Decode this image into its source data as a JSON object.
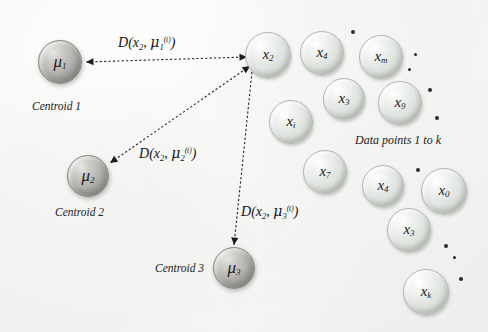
{
  "figure": {
    "background_color": "#f5f5f4",
    "data_node_color": "#dfe3df",
    "centroid_node_color": "#b3b2ae",
    "ink_color": "#1b1b1b"
  },
  "centroids": [
    {
      "id": "mu1",
      "symbol": "μ",
      "sub": "1",
      "caption": "Centroid 1",
      "x": 60,
      "y": 62,
      "r": 22
    },
    {
      "id": "mu2",
      "symbol": "μ",
      "sub": "2",
      "caption": "Centroid 2",
      "x": 88,
      "y": 176,
      "r": 21
    },
    {
      "id": "mu3",
      "symbol": "μ",
      "sub": "3",
      "caption": "Centroid 3",
      "x": 234,
      "y": 268,
      "r": 21
    }
  ],
  "data_points": [
    {
      "id": "x2",
      "symbol": "x",
      "sub": "2",
      "x": 268,
      "y": 55,
      "r": 23
    },
    {
      "id": "x4a",
      "symbol": "x",
      "sub": "4",
      "x": 322,
      "y": 53,
      "r": 22
    },
    {
      "id": "xm",
      "symbol": "x",
      "sub": "m",
      "x": 381,
      "y": 57,
      "r": 22
    },
    {
      "id": "x3a",
      "symbol": "x",
      "sub": "3",
      "x": 344,
      "y": 99,
      "r": 21
    },
    {
      "id": "x9",
      "symbol": "x",
      "sub": "9",
      "x": 400,
      "y": 103,
      "r": 22
    },
    {
      "id": "xi",
      "symbol": "x",
      "sub": "i",
      "x": 291,
      "y": 122,
      "r": 22
    },
    {
      "id": "x7",
      "symbol": "x",
      "sub": "7",
      "x": 325,
      "y": 172,
      "r": 22
    },
    {
      "id": "x4b",
      "symbol": "x",
      "sub": "4",
      "x": 383,
      "y": 186,
      "r": 21
    },
    {
      "id": "x0",
      "symbol": "x",
      "sub": "0",
      "x": 444,
      "y": 191,
      "r": 23
    },
    {
      "id": "x3b",
      "symbol": "x",
      "sub": "3",
      "x": 409,
      "y": 230,
      "r": 22
    },
    {
      "id": "xk",
      "symbol": "x",
      "sub": "k",
      "x": 426,
      "y": 292,
      "r": 23
    }
  ],
  "ellipsis_dots": [
    {
      "x": 351,
      "y": 30,
      "size": "lg"
    },
    {
      "x": 414,
      "y": 53,
      "size": "sm"
    },
    {
      "x": 408,
      "y": 68,
      "size": "sm"
    },
    {
      "x": 428,
      "y": 88,
      "size": "lg"
    },
    {
      "x": 435,
      "y": 116,
      "size": "lg"
    },
    {
      "x": 416,
      "y": 168,
      "size": "lg"
    },
    {
      "x": 444,
      "y": 244,
      "size": "lg"
    },
    {
      "x": 453,
      "y": 256,
      "size": "sm"
    },
    {
      "x": 459,
      "y": 277,
      "size": "lg"
    }
  ],
  "distance_labels": [
    {
      "id": "d1",
      "text": "D(x₂, μ₁⁽ᵗ⁾)",
      "d": "D",
      "arg": "x",
      "arg_sub": "2",
      "mu": "μ",
      "mu_sub": "1",
      "mu_sup": "(t)",
      "x": 118,
      "y": 34
    },
    {
      "id": "d2",
      "text": "D(x₂, μ₂⁽ᵗ⁾)",
      "d": "D",
      "arg": "x",
      "arg_sub": "2",
      "mu": "μ",
      "mu_sub": "2",
      "mu_sup": "(t)",
      "x": 139,
      "y": 145
    },
    {
      "id": "d3",
      "text": "D(x₂, μ₃⁽ᵗ⁾)",
      "d": "D",
      "arg": "x",
      "arg_sub": "2",
      "mu": "μ",
      "mu_sub": "3",
      "mu_sup": "(t)",
      "x": 241,
      "y": 203
    }
  ],
  "annotations": [
    {
      "id": "cluster-caption",
      "text": "Data points 1 to k",
      "x": 355,
      "y": 133
    }
  ],
  "arrows": [
    {
      "id": "arrow-to-mu1",
      "from": "x2",
      "to": "mu1",
      "x1": 247,
      "y1": 57,
      "x2": 86,
      "y2": 62,
      "style": "dashed",
      "arrowheads": "both"
    },
    {
      "id": "arrow-to-mu2",
      "from": "x2",
      "to": "mu2",
      "x1": 250,
      "y1": 66,
      "x2": 110,
      "y2": 163,
      "style": "dashed",
      "arrowheads": "both"
    },
    {
      "id": "arrow-to-mu3",
      "from": "x2",
      "to": "mu3",
      "x1": 252,
      "y1": 72,
      "x2": 234,
      "y2": 245,
      "style": "dashed",
      "arrowheads": "end"
    }
  ]
}
